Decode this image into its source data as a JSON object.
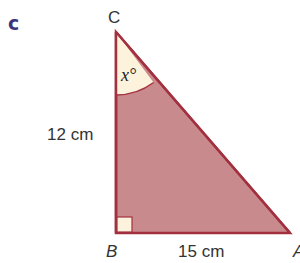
{
  "part_label": "c",
  "vertices": {
    "C": {
      "label": "C",
      "x": 116,
      "y": 32
    },
    "B": {
      "label": "B",
      "x": 116,
      "y": 233
    },
    "A": {
      "label": "A",
      "x": 290,
      "y": 233
    }
  },
  "sides": {
    "BC": "12 cm",
    "AB": "15 cm"
  },
  "angle_label": "x°",
  "colors": {
    "fill": "#c98a8e",
    "stroke": "#a3303f",
    "angle_sector": "#fdf3dc",
    "right_angle_box": "#fdf3dc",
    "part_label": "#3b3580"
  }
}
